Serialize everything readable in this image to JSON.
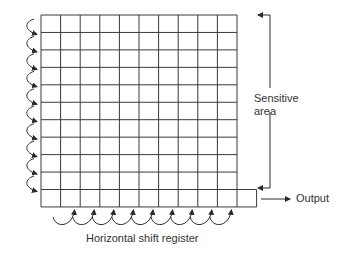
{
  "diagram": {
    "labels": {
      "sensitive_area_line1": "Sensitive",
      "sensitive_area_line2": "area",
      "output": "Output",
      "horizontal_shift_register": "Horizontal shift register"
    },
    "grid": {
      "columns": 10,
      "rows": 11,
      "sensitive_rows": 10,
      "shift_register_cells": 11
    },
    "arrows": {
      "vertical_shift_count": 10,
      "horizontal_shift_count": 9
    },
    "colors": {
      "line": "#3a3a3a",
      "text": "#333333",
      "background": "#ffffff"
    }
  }
}
